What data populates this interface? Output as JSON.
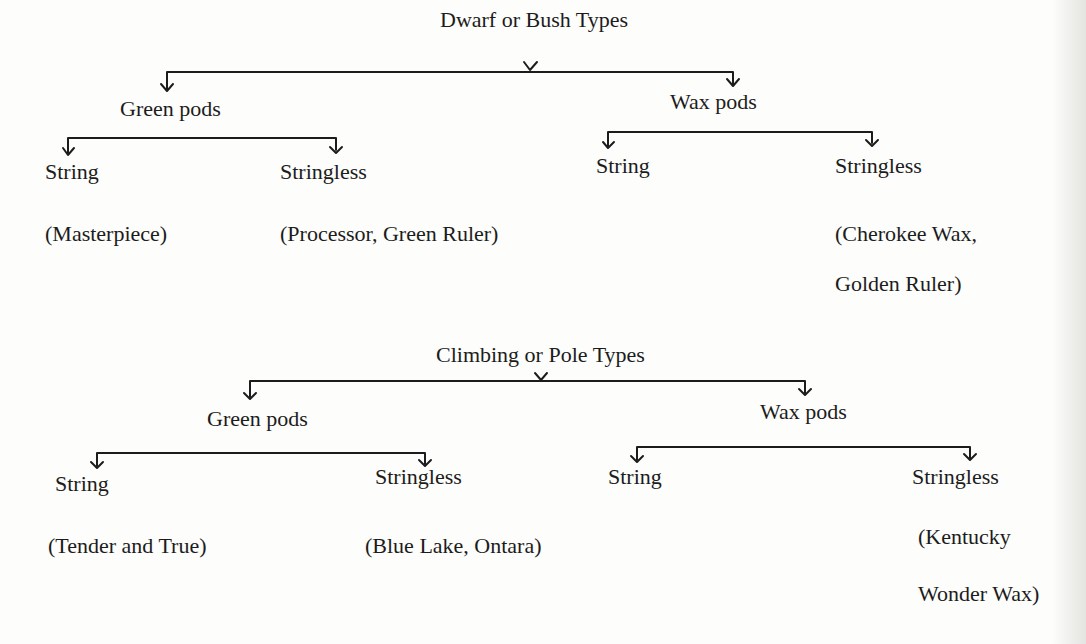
{
  "diagram": {
    "trees": [
      {
        "root": "Dwarf or Bush Types",
        "branches": [
          {
            "label": "Green pods",
            "children": [
              {
                "label": "String",
                "examples": [
                  "(Masterpiece)"
                ]
              },
              {
                "label": "Stringless",
                "examples": [
                  "(Processor, Green Ruler)"
                ]
              }
            ]
          },
          {
            "label": "Wax pods",
            "children": [
              {
                "label": "String",
                "examples": []
              },
              {
                "label": "Stringless",
                "examples": [
                  "(Cherokee Wax,",
                  "Golden Ruler)"
                ]
              }
            ]
          }
        ]
      },
      {
        "root": "Climbing or Pole Types",
        "branches": [
          {
            "label": "Green pods",
            "children": [
              {
                "label": "String",
                "examples": [
                  "(Tender and True)"
                ]
              },
              {
                "label": "Stringless",
                "examples": [
                  "(Blue Lake, Ontara)"
                ]
              }
            ]
          },
          {
            "label": "Wax pods",
            "children": [
              {
                "label": "String",
                "examples": []
              },
              {
                "label": "Stringless",
                "examples": [
                  "(Kentucky",
                  "Wonder Wax)"
                ]
              }
            ]
          }
        ]
      }
    ]
  },
  "colors": {
    "ink": "#1c1c1c",
    "paper": "#fdfdfb"
  }
}
